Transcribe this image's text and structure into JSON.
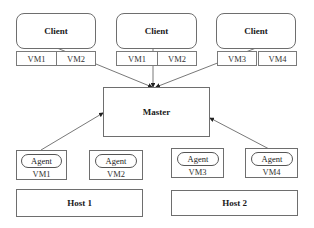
{
  "diagram": {
    "clients": [
      {
        "label": "Client",
        "vms": [
          "VM1",
          "VM2"
        ]
      },
      {
        "label": "Client",
        "vms": [
          "VM1",
          "VM2"
        ]
      },
      {
        "label": "Client",
        "vms": [
          "VM3",
          "VM4"
        ]
      }
    ],
    "master": {
      "label": "Master"
    },
    "agent_vms": [
      {
        "agent_label": "Agent",
        "vm_label": "VM1"
      },
      {
        "agent_label": "Agent",
        "vm_label": "VM2"
      },
      {
        "agent_label": "Agent",
        "vm_label": "VM3"
      },
      {
        "agent_label": "Agent",
        "vm_label": "VM4"
      }
    ],
    "hosts": [
      {
        "label": "Host 1"
      },
      {
        "label": "Host 2"
      }
    ],
    "edges": [
      {
        "from": "client-1",
        "to": "master"
      },
      {
        "from": "client-2",
        "to": "master"
      },
      {
        "from": "client-3",
        "to": "master"
      },
      {
        "from": "agent-vm1",
        "to": "master"
      },
      {
        "from": "agent-vm4",
        "to": "master"
      }
    ],
    "colors": {
      "stroke": "#6e6e6e",
      "text": "#1a1a1a",
      "background": "#ffffff"
    }
  }
}
